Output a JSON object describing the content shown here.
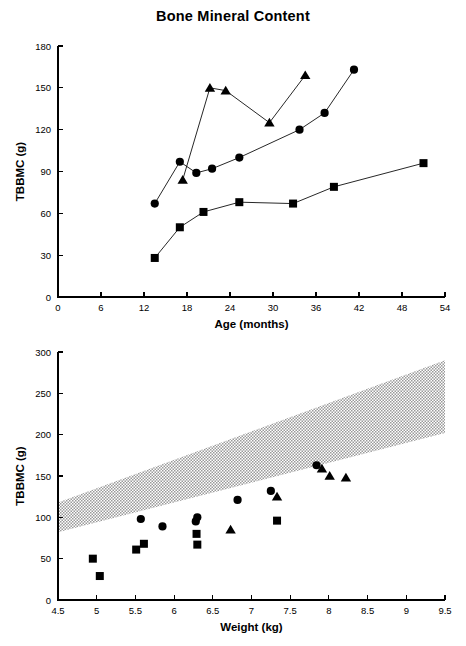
{
  "figure": {
    "title": "Bone Mineral Content",
    "background": "#ffffff",
    "ink_color": "#000000",
    "band_color": "#b9b9b9"
  },
  "chart_data": [
    {
      "type": "line",
      "title": "Bone Mineral Content",
      "xlabel": "Age (months)",
      "ylabel": "TBBMC (g)",
      "xlim": [
        0,
        54
      ],
      "ylim": [
        0,
        180
      ],
      "xticks": [
        0,
        6,
        12,
        18,
        24,
        30,
        36,
        42,
        48,
        54
      ],
      "yticks": [
        0,
        30,
        60,
        90,
        120,
        150,
        180
      ],
      "grid": false,
      "legend": "none",
      "series": [
        {
          "name": "subject-circles",
          "marker": "circle",
          "x": [
            13.5,
            17.0,
            19.3,
            21.5,
            25.3,
            33.7,
            37.2,
            41.3
          ],
          "y": [
            67,
            97,
            89,
            92,
            100,
            120,
            132,
            163
          ]
        },
        {
          "name": "subject-triangles",
          "marker": "triangle",
          "x": [
            17.4,
            21.2,
            23.4,
            29.5,
            34.5
          ],
          "y": [
            84,
            150,
            148,
            125,
            159
          ]
        },
        {
          "name": "subject-squares",
          "marker": "square",
          "x": [
            13.5,
            17.0,
            20.3,
            25.3,
            32.8,
            38.5,
            51.0
          ],
          "y": [
            28,
            50,
            61,
            68,
            67,
            79,
            96
          ]
        }
      ]
    },
    {
      "type": "scatter",
      "title": "",
      "xlabel": "Weight (kg)",
      "ylabel": "TBBMC (g)",
      "xlim": [
        4.5,
        9.5
      ],
      "ylim": [
        0,
        300
      ],
      "xticks": [
        4.5,
        5,
        5.5,
        6,
        6.5,
        7,
        7.5,
        8,
        8.5,
        9,
        9.5
      ],
      "yticks": [
        0,
        50,
        100,
        150,
        200,
        250,
        300
      ],
      "grid": false,
      "legend": "none",
      "reference_band": {
        "name": "normal-reference-range",
        "x": [
          4.5,
          9.5
        ],
        "upper": [
          118,
          290
        ],
        "lower": [
          82,
          202
        ]
      },
      "series": [
        {
          "name": "subject-circles",
          "marker": "circle",
          "x": [
            5.57,
            5.85,
            6.28,
            6.3,
            6.82,
            7.25,
            7.84
          ],
          "y": [
            98,
            89,
            95,
            100,
            121,
            132,
            163
          ]
        },
        {
          "name": "subject-triangles",
          "marker": "triangle",
          "x": [
            6.73,
            7.33,
            7.91,
            8.01,
            8.22
          ],
          "y": [
            85,
            125,
            159,
            150,
            148
          ]
        },
        {
          "name": "subject-squares",
          "marker": "square",
          "x": [
            4.95,
            5.04,
            5.51,
            5.61,
            6.29,
            6.3,
            7.33
          ],
          "y": [
            50,
            29,
            61,
            68,
            80,
            67,
            96
          ]
        }
      ]
    }
  ],
  "top_chart": {
    "title": "Bone Mineral Content",
    "xlabel": "Age (months)",
    "ylabel": "TBBMC (g)",
    "xticks": [
      "0",
      "6",
      "12",
      "18",
      "24",
      "30",
      "36",
      "42",
      "48",
      "54"
    ],
    "yticks": [
      "0",
      "30",
      "60",
      "90",
      "120",
      "150",
      "180"
    ]
  },
  "bottom_chart": {
    "xlabel": "Weight (kg)",
    "ylabel": "TBBMC (g)",
    "xticks": [
      "4.5",
      "5",
      "5.5",
      "6",
      "6.5",
      "7",
      "7.5",
      "8",
      "8.5",
      "9",
      "9.5"
    ],
    "yticks": [
      "0",
      "50",
      "100",
      "150",
      "200",
      "250",
      "300"
    ]
  }
}
